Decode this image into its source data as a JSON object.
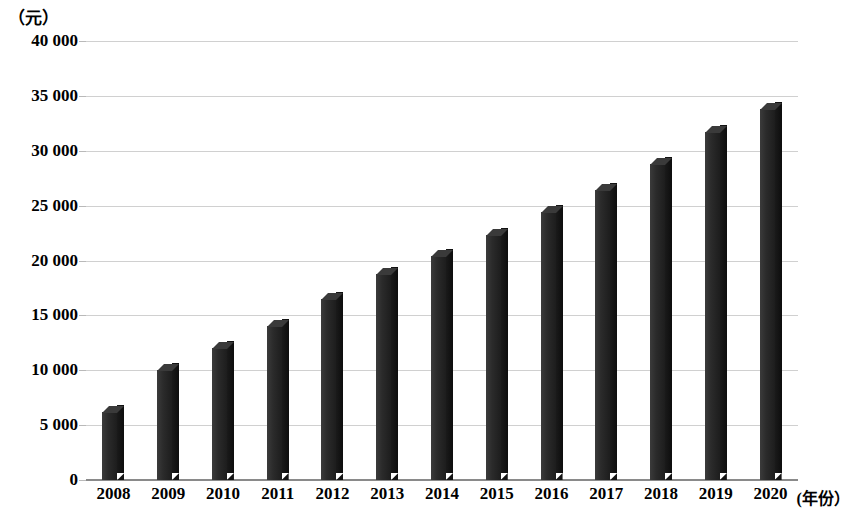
{
  "chart_data": {
    "type": "bar",
    "title": "",
    "subtitle": "",
    "unit_caption": "（元）",
    "xlabel": "(年份）",
    "ylabel": "",
    "categories": [
      "2008",
      "2009",
      "2010",
      "2011",
      "2012",
      "2013",
      "2014",
      "2015",
      "2016",
      "2017",
      "2018",
      "2019",
      "2020"
    ],
    "values": [
      6200,
      10000,
      12000,
      14000,
      16500,
      18800,
      20400,
      22300,
      24400,
      26400,
      28800,
      31700,
      33800
    ],
    "ylim": [
      0,
      40000
    ],
    "ytick_values": [
      0,
      5000,
      10000,
      15000,
      20000,
      25000,
      30000,
      35000,
      40000
    ],
    "ytick_labels": [
      "0",
      "5 000",
      "10 000",
      "15 000",
      "20 000",
      "25 000",
      "30 000",
      "35 000",
      "40 000"
    ],
    "grid": true,
    "legend": "none",
    "series_color": "#2b2b2b",
    "gridline_color": "#d0d0d0",
    "axis_color": "#8a8a8a",
    "bar_style": "3d-column"
  }
}
